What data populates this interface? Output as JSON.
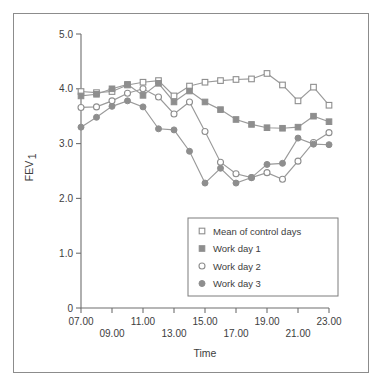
{
  "figure": {
    "y_axis_label_main": "FEV",
    "y_axis_label_sub": "1",
    "x_axis_label": "Time"
  },
  "legend": {
    "entries": [
      {
        "label": "Mean of control days",
        "marker": "open-square"
      },
      {
        "label": "Work day 1",
        "marker": "filled-square"
      },
      {
        "label": "Work day 2",
        "marker": "open-circle"
      },
      {
        "label": "Work day 3",
        "marker": "filled-circle"
      }
    ]
  },
  "colors": {
    "marker_gray": "#8e8e8e",
    "line_gray": "#9a9a9a",
    "axis_gray": "#6f6f6f",
    "text_gray": "#3d3d3d",
    "frame_gray": "#8c8c8c",
    "background": "#ffffff"
  },
  "chart_data": {
    "type": "line",
    "title": "",
    "xlabel": "Time",
    "ylabel": "FEV1",
    "xlim": [
      7,
      23
    ],
    "ylim": [
      0,
      5
    ],
    "grid": false,
    "legend_position": "inside-lower-right",
    "y_ticks": [
      "0",
      "1.0",
      "2.0",
      "3.0",
      "4.0",
      "5.0"
    ],
    "y_tick_values": [
      0,
      1.0,
      2.0,
      3.0,
      4.0,
      5.0
    ],
    "x_ticks": [
      "07.00",
      "09.00",
      "11.00",
      "13.00",
      "15.00",
      "17.00",
      "19.00",
      "21.00",
      "23.00"
    ],
    "x_tick_values": [
      7,
      9,
      11,
      13,
      15,
      17,
      19,
      21,
      23
    ],
    "x": [
      7,
      8,
      9,
      10,
      11,
      12,
      13,
      14,
      15,
      16,
      17,
      18,
      19,
      20,
      21,
      22,
      23
    ],
    "series": [
      {
        "name": "Mean of control days",
        "marker": "open-square",
        "values": [
          3.95,
          3.93,
          3.95,
          4.07,
          4.12,
          4.15,
          3.87,
          4.05,
          4.12,
          4.15,
          4.17,
          4.18,
          4.28,
          4.07,
          3.78,
          4.03,
          3.7
        ]
      },
      {
        "name": "Work day 1",
        "marker": "filled-square",
        "values": [
          3.87,
          3.9,
          4.0,
          4.08,
          3.88,
          4.1,
          3.76,
          3.96,
          3.76,
          3.62,
          3.44,
          3.35,
          3.29,
          3.28,
          3.3,
          3.5,
          3.4
        ]
      },
      {
        "name": "Work day 2",
        "marker": "open-circle",
        "values": [
          3.66,
          3.67,
          3.78,
          3.92,
          4.0,
          3.85,
          3.54,
          3.76,
          3.22,
          2.66,
          2.45,
          2.38,
          2.47,
          2.35,
          2.68,
          3.02,
          3.2
        ]
      },
      {
        "name": "Work day 3",
        "marker": "filled-circle",
        "values": [
          3.3,
          3.48,
          3.68,
          3.78,
          3.67,
          3.27,
          3.25,
          2.86,
          2.28,
          2.55,
          2.28,
          2.38,
          2.62,
          2.64,
          3.1,
          2.99,
          2.98
        ]
      }
    ]
  }
}
